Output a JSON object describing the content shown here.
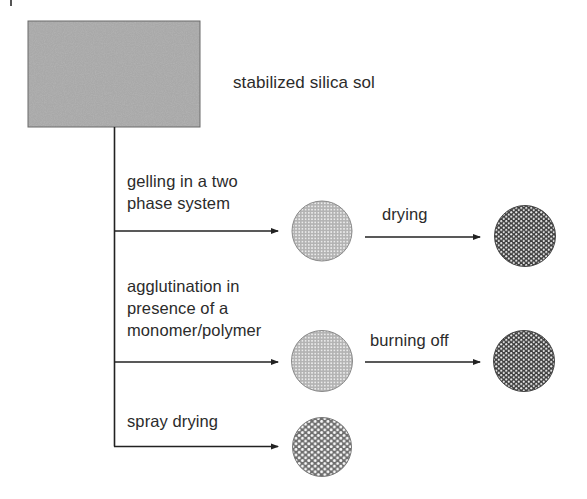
{
  "diagram": {
    "source_box": {
      "label": "stabilized silica sol",
      "fill": "#a8a8a8"
    },
    "routes": [
      {
        "id": "two-phase",
        "label_lines": [
          "gelling in a two",
          "phase system"
        ],
        "intermediate": "gel-particle",
        "next_step": {
          "label": "drying",
          "product": "dried-particle"
        }
      },
      {
        "id": "agglutination",
        "label_lines": [
          "agglutination in",
          "presence of a",
          "monomer/polymer"
        ],
        "intermediate": "agglutinated-particle",
        "next_step": {
          "label": "burning off",
          "product": "burnt-particle"
        }
      },
      {
        "id": "spray",
        "label_lines": [
          "spray drying"
        ],
        "intermediate": "spray-dried-particle",
        "next_step": null
      }
    ],
    "colors": {
      "line": "#222222",
      "text": "#2b2b2b",
      "light_particle": "#bdbdbd",
      "dark_particle": "#4a4a4a"
    }
  }
}
